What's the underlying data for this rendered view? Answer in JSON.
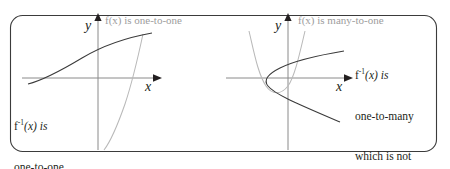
{
  "figure": {
    "caption_kind": "math-diagram",
    "frame": {
      "shape": "rounded-rectangle",
      "stroke_color": "#3b3b3b",
      "fill_color": "#ffffff",
      "corner_radius_px": 12,
      "x": 10,
      "y": 15,
      "width": 427,
      "height": 137
    },
    "colors": {
      "dark_curve": "#3a3a3a",
      "light_curve": "#b9b9b9",
      "axis": "#8a8a8a",
      "axis_arrow": "#231f20",
      "gray_text": "#9d9d9d",
      "dark_text": "#231f20"
    },
    "panels": [
      {
        "id": "left-panel",
        "axes": {
          "x_label": "x",
          "y_label": "y"
        },
        "labels": [
          {
            "id": "f-one-to-one",
            "tone": "gray",
            "lines": [
              "f(x) is one-to-one"
            ]
          },
          {
            "id": "finv-one-to-one",
            "tone": "dark",
            "lines": [
              "f⁻¹(x) is",
              "one-to-one"
            ],
            "line1_pre": "f",
            "line1_sup": "-1",
            "line1_post": "(x) is",
            "line2": "one-to-one"
          }
        ],
        "curves": [
          {
            "id": "f-exponential",
            "tone": "light",
            "description": "exponential curve rising steeply through origin region"
          },
          {
            "id": "finv-logarithmic",
            "tone": "dark",
            "description": "logarithmic curve rising and flattening"
          }
        ]
      },
      {
        "id": "right-panel",
        "axes": {
          "x_label": "x",
          "y_label": "y"
        },
        "labels": [
          {
            "id": "f-many-to-one",
            "tone": "gray",
            "lines": [
              "f(x) is many-to-one"
            ]
          },
          {
            "id": "finv-one-to-many",
            "tone": "dark",
            "lines": [
              "f⁻¹(x) is",
              "one-to-many",
              "which is not",
              "a function"
            ],
            "line1_pre": "f",
            "line1_sup": "-1",
            "line1_post": "(x) is",
            "line2": "one-to-many",
            "line3": "which is not",
            "line4": "a function"
          }
        ],
        "curves": [
          {
            "id": "f-parabola-up",
            "tone": "light",
            "description": "upward opening parabola, vertex below x-axis"
          },
          {
            "id": "finv-parabola-right",
            "tone": "dark",
            "description": "rightward opening parabola, vertex left of y-axis"
          }
        ]
      }
    ]
  }
}
